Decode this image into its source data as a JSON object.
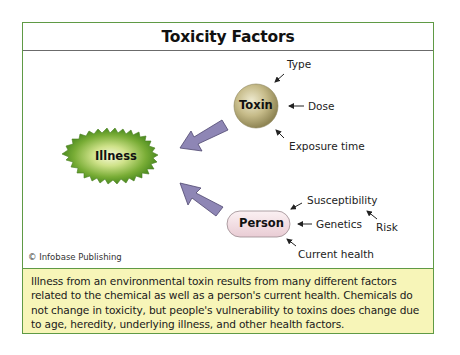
{
  "title": "Toxicity Factors",
  "nodes": {
    "illness": "Illness",
    "toxin": "Toxin",
    "person": "Person"
  },
  "toxin_factors": {
    "type": "Type",
    "dose": "Dose",
    "exposure_time": "Exposure time"
  },
  "person_factors": {
    "susceptibility": "Susceptibility",
    "genetics": "Genetics",
    "current_health": "Current health",
    "risk": "Risk"
  },
  "credit": "© Infobase Publishing",
  "caption": "Illness from an environmental toxin results from many different factors related to the chemical as well as a person's current health. Chemicals do not change in toxicity, but people's vulnerability to toxins does change due to age, heredity, underlying illness, and other health factors.",
  "colors": {
    "frame_border": "#5f9a45",
    "caption_bg": "#f7f5b8",
    "arrow_fill": "#8e86b5",
    "illness_green": "#5e9a2a",
    "toxin_tan": "#b9ad79",
    "person_pink": "#f1dde2"
  }
}
